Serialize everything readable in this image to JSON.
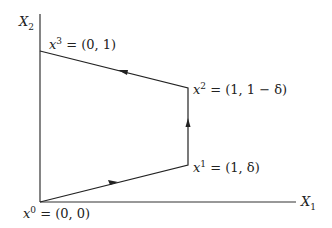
{
  "axes": {
    "x_label": "X",
    "x_sub": "1",
    "y_label": "X",
    "y_sub": "2"
  },
  "points": [
    {
      "name": "x",
      "sup": "0",
      "value": " = (0, 0)"
    },
    {
      "name": "x",
      "sup": "1",
      "value": " = (1, δ)"
    },
    {
      "name": "x",
      "sup": "2",
      "value": " = (1, 1 − δ)"
    },
    {
      "name": "x",
      "sup": "3",
      "value": " = (0, 1)"
    }
  ],
  "path_order": [
    "x0",
    "x1",
    "x2",
    "x3"
  ],
  "colors": {
    "line": "#222222",
    "axis": "#333333"
  }
}
